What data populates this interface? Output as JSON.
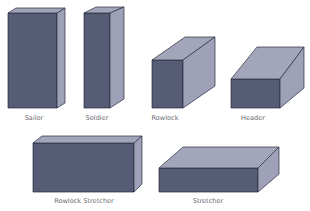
{
  "diagram": {
    "colors": {
      "front_face": "#565b76",
      "side_face": "#9ea1b7",
      "top_face": "#a3a6bb",
      "edge": "#2a2d3e",
      "label": "#6b6b70",
      "background": "#ffffff"
    },
    "bricks": [
      {
        "id": "sailor",
        "label": "Sailor",
        "front": [
          [
            8,
            13
          ],
          [
            57,
            13
          ],
          [
            57,
            108
          ],
          [
            8,
            108
          ]
        ],
        "top": [
          [
            8,
            13
          ],
          [
            16,
            8
          ],
          [
            65,
            8
          ],
          [
            57,
            13
          ]
        ],
        "side": [
          [
            57,
            13
          ],
          [
            65,
            8
          ],
          [
            65,
            103
          ],
          [
            57,
            108
          ]
        ],
        "label_pos": [
          34,
          120
        ]
      },
      {
        "id": "soldier",
        "label": "Soldier",
        "front": [
          [
            84,
            13
          ],
          [
            110,
            13
          ],
          [
            110,
            108
          ],
          [
            84,
            108
          ]
        ],
        "top": [
          [
            84,
            13
          ],
          [
            96,
            7
          ],
          [
            124,
            7
          ],
          [
            110,
            13
          ]
        ],
        "side": [
          [
            110,
            13
          ],
          [
            124,
            7
          ],
          [
            124,
            99
          ],
          [
            110,
            108
          ]
        ],
        "label_pos": [
          97,
          120
        ]
      },
      {
        "id": "rowlock",
        "label": "Rowlock",
        "front": [
          [
            152,
            60
          ],
          [
            183,
            60
          ],
          [
            183,
            108
          ],
          [
            152,
            108
          ]
        ],
        "top": [
          [
            152,
            60
          ],
          [
            185,
            37
          ],
          [
            215,
            37
          ],
          [
            183,
            60
          ]
        ],
        "side": [
          [
            183,
            60
          ],
          [
            215,
            37
          ],
          [
            215,
            86
          ],
          [
            183,
            108
          ]
        ],
        "label_pos": [
          165,
          120
        ]
      },
      {
        "id": "header",
        "label": "Header",
        "front": [
          [
            231,
            79
          ],
          [
            280,
            79
          ],
          [
            280,
            108
          ],
          [
            231,
            108
          ]
        ],
        "top": [
          [
            231,
            79
          ],
          [
            257,
            47
          ],
          [
            304,
            47
          ],
          [
            280,
            79
          ]
        ],
        "side": [
          [
            280,
            79
          ],
          [
            304,
            47
          ],
          [
            304,
            88
          ],
          [
            280,
            108
          ]
        ],
        "label_pos": [
          253,
          120
        ]
      },
      {
        "id": "rowlock-stretcher",
        "label": "Rowlock Stretcher",
        "front": [
          [
            33,
            143
          ],
          [
            134,
            143
          ],
          [
            134,
            192
          ],
          [
            33,
            192
          ]
        ],
        "top": [
          [
            33,
            143
          ],
          [
            42,
            136
          ],
          [
            142,
            136
          ],
          [
            134,
            143
          ]
        ],
        "side": [
          [
            134,
            143
          ],
          [
            142,
            136
          ],
          [
            142,
            184
          ],
          [
            134,
            192
          ]
        ],
        "label_pos": [
          84,
          203
        ]
      },
      {
        "id": "stretcher",
        "label": "Stretcher",
        "front": [
          [
            159,
            168
          ],
          [
            258,
            168
          ],
          [
            258,
            192
          ],
          [
            159,
            192
          ]
        ],
        "top": [
          [
            159,
            168
          ],
          [
            183,
            147
          ],
          [
            279,
            147
          ],
          [
            258,
            168
          ]
        ],
        "side": [
          [
            258,
            168
          ],
          [
            279,
            147
          ],
          [
            279,
            174
          ],
          [
            258,
            192
          ]
        ],
        "label_pos": [
          208,
          203
        ]
      }
    ]
  }
}
